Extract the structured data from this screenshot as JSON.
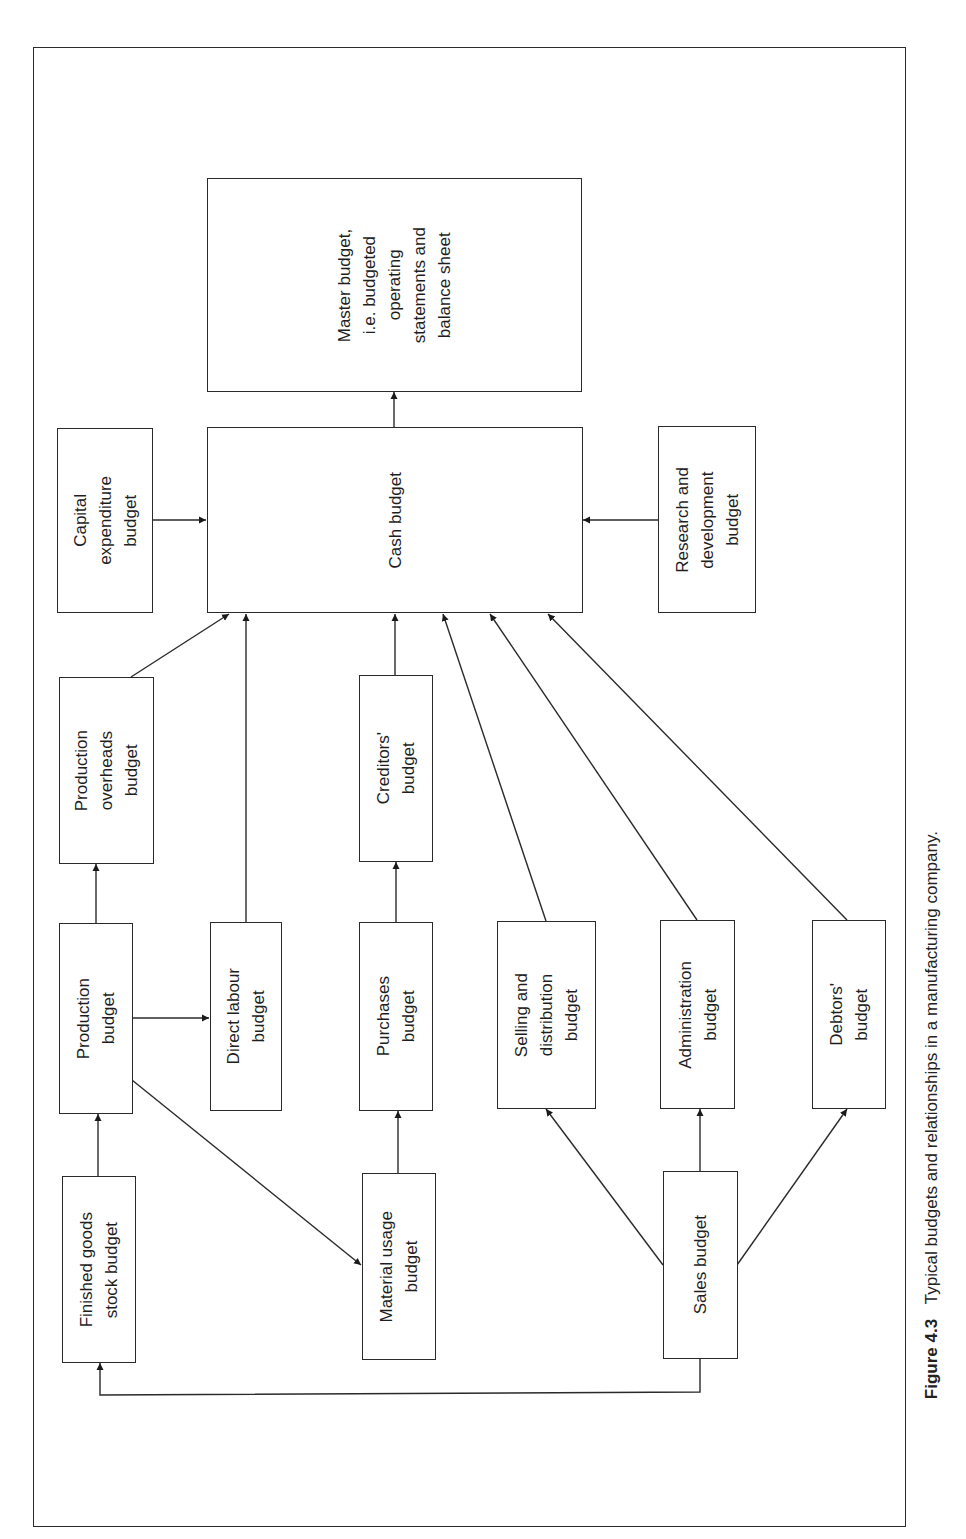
{
  "figure": {
    "number": "Figure 4.3",
    "caption": "Typical budgets and relationships in a manufacturing company."
  },
  "boxes": {
    "master": "Master budget,\ni.e. budgeted\noperating\nstatements and\nbalance sheet",
    "cash": "Cash budget",
    "capital": "Capital\nexpenditure\nbudget",
    "research": "Research and\ndevelopment\nbudget",
    "prod_overheads": "Production\noverheads\nbudget",
    "creditors": "Creditors'\nbudget",
    "production": "Production\nbudget",
    "direct_labour": "Direct labour\nbudget",
    "purchases": "Purchases\nbudget",
    "selling": "Selling and\ndistribution\nbudget",
    "administration": "Administration\nbudget",
    "debtors": "Debtors'\nbudget",
    "finished_goods": "Finished goods\nstock budget",
    "material_usage": "Material usage\nbudget",
    "sales": "Sales budget"
  },
  "relationships": [
    {
      "from": "Cash budget",
      "to": "Master budget"
    },
    {
      "from": "Capital expenditure budget",
      "to": "Cash budget"
    },
    {
      "from": "Research and development budget",
      "to": "Cash budget"
    },
    {
      "from": "Production overheads budget",
      "to": "Cash budget"
    },
    {
      "from": "Direct labour budget",
      "to": "Cash budget"
    },
    {
      "from": "Creditors' budget",
      "to": "Cash budget"
    },
    {
      "from": "Selling and distribution budget",
      "to": "Cash budget"
    },
    {
      "from": "Administration budget",
      "to": "Cash budget"
    },
    {
      "from": "Debtors' budget",
      "to": "Cash budget"
    },
    {
      "from": "Production budget",
      "to": "Production overheads budget"
    },
    {
      "from": "Production budget",
      "to": "Direct labour budget"
    },
    {
      "from": "Production budget",
      "to": "Material usage budget"
    },
    {
      "from": "Purchases budget",
      "to": "Creditors' budget"
    },
    {
      "from": "Material usage budget",
      "to": "Purchases budget"
    },
    {
      "from": "Finished goods stock budget",
      "to": "Production budget"
    },
    {
      "from": "Sales budget",
      "to": "Selling and distribution budget"
    },
    {
      "from": "Sales budget",
      "to": "Administration budget"
    },
    {
      "from": "Sales budget",
      "to": "Debtors' budget"
    },
    {
      "from": "Sales budget",
      "to": "Finished goods stock budget"
    }
  ],
  "colors": {
    "line": "#2a2a2a",
    "background": "#ffffff"
  }
}
